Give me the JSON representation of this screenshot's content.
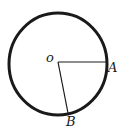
{
  "diagram": {
    "type": "circle-with-radii",
    "center": {
      "label": "o",
      "x": 58,
      "y": 62
    },
    "circle": {
      "rx": 49,
      "ry": 51,
      "stroke": "#1a1a1a",
      "stroke_width": 3
    },
    "points": [
      {
        "label": "A",
        "x": 107,
        "y": 62
      },
      {
        "label": "B",
        "x": 68,
        "y": 112
      }
    ],
    "segments": [
      {
        "from": "o",
        "to": "A"
      },
      {
        "from": "o",
        "to": "B"
      }
    ],
    "line_color": "#1a1a1a"
  }
}
